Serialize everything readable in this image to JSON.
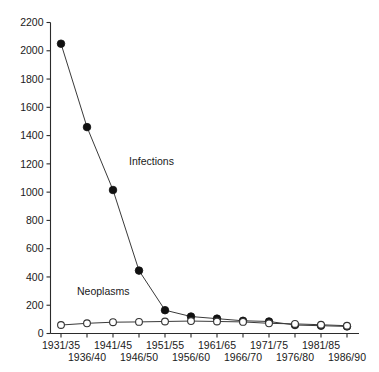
{
  "chart_data": {
    "type": "line",
    "title": "",
    "subtitle": "",
    "xlabel": "",
    "ylabel": "",
    "ylim": [
      0,
      2200
    ],
    "ytick_step": 200,
    "yticks": [
      0,
      200,
      400,
      600,
      800,
      1000,
      1200,
      1400,
      1600,
      1800,
      2000,
      2200
    ],
    "ytick_labels": [
      "0",
      "200",
      "400",
      "600",
      "800",
      "1000",
      "1200",
      "1400",
      "1600",
      "1800",
      "2000",
      "2200"
    ],
    "grid": false,
    "legend": "inline-annotations",
    "categories": [
      "1931/35",
      "1936/40",
      "1941/45",
      "1946/50",
      "1951/55",
      "1956/60",
      "1961/65",
      "1966/70",
      "1971/75",
      "1976/80",
      "1981/85",
      "1986/90"
    ],
    "xtick_labels_top": [
      "1931/35",
      "",
      "1941/45",
      "",
      "1951/55",
      "",
      "1961/65",
      "",
      "1971/75",
      "",
      "1981/85",
      ""
    ],
    "xtick_labels_bottom": [
      "",
      "1936/40",
      "",
      "1946/50",
      "",
      "1956/60",
      "",
      "1966/70",
      "",
      "1976/80",
      "",
      "1986/90"
    ],
    "series": [
      {
        "name": "Infections",
        "marker": "filled-circle",
        "values": [
          2050,
          1460,
          1015,
          445,
          165,
          120,
          105,
          90,
          85,
          60,
          55,
          50
        ]
      },
      {
        "name": "Neoplasms",
        "marker": "open-circle",
        "values": [
          60,
          72,
          80,
          82,
          85,
          88,
          85,
          82,
          72,
          68,
          62,
          55
        ]
      }
    ],
    "annotations": [
      {
        "text": "Infections",
        "category": "1946/50",
        "value": 1190
      },
      {
        "text": "Neoplasms",
        "category": "1936/40",
        "value": 270
      }
    ],
    "colors": {
      "axis": "#2b2b2b",
      "line": "#3a3a3a",
      "filled_marker": "#111111",
      "open_marker_fill": "#ffffff",
      "open_marker_stroke": "#333333",
      "background": "#ffffff",
      "text": "#1a1a1a"
    }
  }
}
